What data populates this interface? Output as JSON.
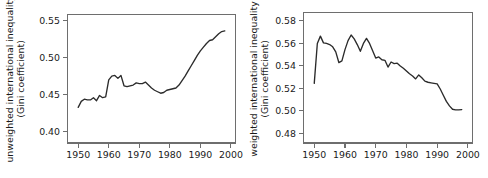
{
  "figure": {
    "background": "#ffffff",
    "line_color": "#2b2b2b",
    "axis_color": "#6e6e6e",
    "text_color": "#1a1a1a"
  },
  "chart_data": [
    {
      "type": "line",
      "panel": "left",
      "title": "",
      "xlabel": "",
      "ylabel_line1": "unweighted international inequality",
      "ylabel_line2": "(Gini coefficient)",
      "xlim": [
        1946.5,
        2001.5
      ],
      "ylim": [
        0.385,
        0.558
      ],
      "xticks": [
        1950,
        1960,
        1970,
        1980,
        1990,
        2000
      ],
      "xticklabels": [
        "1950",
        "1960",
        "1970",
        "1980",
        "1990",
        "2000"
      ],
      "yticks": [
        0.4,
        0.45,
        0.5,
        0.55
      ],
      "yticklabels": [
        "0.40",
        "0.45",
        "0.50",
        "0.55"
      ],
      "grid": false,
      "legend": null,
      "x": [
        1950,
        1951,
        1952,
        1953,
        1954,
        1955,
        1956,
        1957,
        1958,
        1959,
        1960,
        1961,
        1962,
        1963,
        1964,
        1965,
        1966,
        1967,
        1968,
        1969,
        1970,
        1971,
        1972,
        1973,
        1974,
        1975,
        1976,
        1977,
        1978,
        1979,
        1980,
        1981,
        1982,
        1983,
        1984,
        1985,
        1986,
        1987,
        1988,
        1989,
        1990,
        1991,
        1992,
        1993,
        1994,
        1995,
        1996,
        1997,
        1998
      ],
      "values": [
        0.433,
        0.441,
        0.444,
        0.443,
        0.443,
        0.446,
        0.442,
        0.449,
        0.446,
        0.447,
        0.47,
        0.475,
        0.476,
        0.472,
        0.476,
        0.462,
        0.461,
        0.462,
        0.463,
        0.466,
        0.465,
        0.465,
        0.467,
        0.463,
        0.459,
        0.456,
        0.454,
        0.452,
        0.453,
        0.456,
        0.457,
        0.458,
        0.459,
        0.463,
        0.469,
        0.475,
        0.482,
        0.489,
        0.496,
        0.503,
        0.509,
        0.514,
        0.519,
        0.523,
        0.524,
        0.528,
        0.532,
        0.535,
        0.536
      ]
    },
    {
      "type": "line",
      "panel": "right",
      "title": "",
      "xlabel": "",
      "ylabel_line1": "weighted international inequality",
      "ylabel_line2": "(Gini coefficient)",
      "xlim": [
        1946.5,
        2001.5
      ],
      "ylim": [
        0.4715,
        0.5875
      ],
      "xticks": [
        1950,
        1960,
        1970,
        1980,
        1990,
        2000
      ],
      "xticklabels": [
        "1950",
        "1960",
        "1970",
        "1980",
        "1990",
        "2000"
      ],
      "yticks": [
        0.48,
        0.5,
        0.52,
        0.54,
        0.56,
        0.58
      ],
      "yticklabels": [
        "0.48",
        "0.50",
        "0.52",
        "0.54",
        "0.56",
        "0.58"
      ],
      "grid": false,
      "legend": null,
      "x": [
        1950,
        1951,
        1952,
        1953,
        1954,
        1955,
        1956,
        1957,
        1958,
        1959,
        1960,
        1961,
        1962,
        1963,
        1964,
        1965,
        1966,
        1967,
        1968,
        1969,
        1970,
        1971,
        1972,
        1973,
        1974,
        1975,
        1976,
        1977,
        1978,
        1979,
        1980,
        1981,
        1982,
        1983,
        1984,
        1985,
        1986,
        1987,
        1988,
        1989,
        1990,
        1991,
        1992,
        1993,
        1994,
        1995,
        1996,
        1997,
        1998
      ],
      "values": [
        0.5245,
        0.56,
        0.5665,
        0.5605,
        0.56,
        0.559,
        0.557,
        0.5525,
        0.543,
        0.5445,
        0.5545,
        0.5625,
        0.5675,
        0.564,
        0.559,
        0.553,
        0.56,
        0.5645,
        0.56,
        0.5535,
        0.547,
        0.548,
        0.5455,
        0.545,
        0.539,
        0.5435,
        0.542,
        0.5425,
        0.54,
        0.538,
        0.5355,
        0.533,
        0.531,
        0.5285,
        0.532,
        0.5295,
        0.5265,
        0.5255,
        0.525,
        0.5245,
        0.524,
        0.5195,
        0.514,
        0.5085,
        0.5045,
        0.5015,
        0.501,
        0.501,
        0.5012
      ]
    }
  ]
}
